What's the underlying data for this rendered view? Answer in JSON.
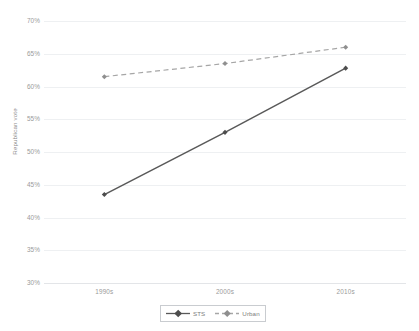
{
  "chart_data": {
    "type": "line",
    "title": "",
    "xlabel": "",
    "ylabel": "Republican vote",
    "categories": [
      "1990s",
      "2000s",
      "2010s"
    ],
    "series": [
      {
        "name": "STS",
        "values": [
          43.5,
          53.0,
          62.8
        ],
        "color": "#595959",
        "linestyle": "solid",
        "marker": "diamond"
      },
      {
        "name": "Urban",
        "values": [
          61.5,
          63.5,
          66.0
        ],
        "color": "#a6a6a6",
        "linestyle": "dashed",
        "marker": "diamond"
      }
    ],
    "ylim": [
      30,
      70
    ],
    "ytick_step": 5,
    "ytick_labels": [
      "70%",
      "65%",
      "60%",
      "55%",
      "50%",
      "45%",
      "40%",
      "35%",
      "30%"
    ],
    "ytick_values": [
      70,
      65,
      60,
      55,
      50,
      45,
      40,
      35,
      30
    ],
    "grid": true,
    "legend_position": "bottom"
  },
  "legend": {
    "entries": [
      {
        "label": "STS"
      },
      {
        "label": "Urban"
      }
    ]
  },
  "colors": {
    "sts": "#595959",
    "urban": "#a6a6a6",
    "gridline": "#eef0f2",
    "axis": "#e3e5e8",
    "tick_text": "#9a9a9a",
    "axis_title": "#8c8c8c"
  }
}
